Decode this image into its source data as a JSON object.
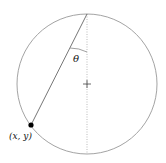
{
  "diagram": {
    "angle_label": "θ",
    "point_label": "(x, y)",
    "colors": {
      "circle": "#999999",
      "chord": "#666666",
      "dotted_axis": "#aaaaaa",
      "point": "#000000"
    }
  }
}
